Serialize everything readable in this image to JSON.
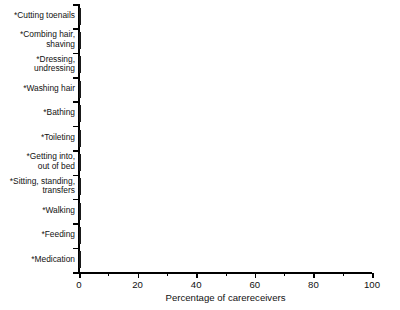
{
  "chart_data": {
    "type": "bar",
    "orientation": "horizontal",
    "title": "",
    "xlabel": "Percentage of carereceivers",
    "ylabel": "",
    "xlim": [
      0,
      100
    ],
    "xticks": [
      0,
      20,
      40,
      60,
      80,
      100
    ],
    "xtick_labels": [
      "0",
      "20",
      "40",
      "60",
      "80",
      "100"
    ],
    "minor_tick_interval": 10,
    "grid": false,
    "legend": null,
    "bar_color": "#8e8e8e",
    "bar_edge_color": "#1a1a1a",
    "categories": [
      "*Cutting toenails",
      "*Combing hair,\nshaving",
      "*Dressing,\nundressing",
      "*Washing hair",
      "*Bathing",
      "*Toileting",
      "*Getting into,\nout of bed",
      "*Sitting, standing,\ntransfers",
      "*Walking",
      "*Feeding",
      "*Medication"
    ],
    "values": [
      97,
      39,
      55,
      74,
      72,
      34,
      33,
      31,
      23,
      26,
      71
    ]
  }
}
